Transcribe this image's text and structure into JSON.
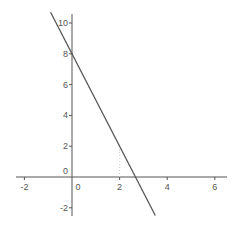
{
  "chart_data": {
    "type": "line",
    "title": "",
    "xlabel": "",
    "ylabel": "",
    "xlim": [
      -2.5,
      6.5
    ],
    "ylim": [
      -2.5,
      10.5
    ],
    "grid": false,
    "x_ticks": [
      -2,
      0,
      2,
      4,
      6
    ],
    "y_ticks": [
      -2,
      0,
      2,
      4,
      6,
      8,
      10
    ],
    "x_tick_labels": [
      "-2",
      "0",
      "2",
      "4",
      "6"
    ],
    "y_tick_labels": [
      "-2",
      "2",
      "4",
      "6",
      "8",
      "10"
    ],
    "origin_label": "0",
    "series": [
      {
        "name": "y = -3x + 8",
        "slope": -3,
        "intercept": 8,
        "x": [
          -0.9,
          3.5
        ],
        "y": [
          10.7,
          -2.5
        ],
        "color": "#555555"
      }
    ],
    "annotations": [
      {
        "type": "dotted-vertical",
        "x": 2,
        "y_from": 0,
        "y_to": 2
      }
    ]
  },
  "colors": {
    "axis": "#555555",
    "line": "#555555",
    "background": "#ffffff"
  }
}
